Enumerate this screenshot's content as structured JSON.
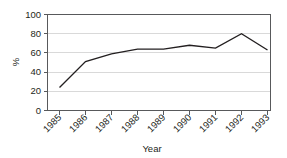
{
  "chart_data": {
    "type": "line",
    "title": "",
    "subtitle": "",
    "xlabel": "Year",
    "ylabel": "%",
    "categories": [
      "1985",
      "1986",
      "1987",
      "1988",
      "1989",
      "1990",
      "1991",
      "1992",
      "1993"
    ],
    "values": [
      24,
      51,
      59,
      64,
      64,
      68,
      65,
      80,
      63
    ],
    "series": [
      {
        "name": "",
        "values": [
          24,
          51,
          59,
          64,
          64,
          68,
          65,
          80,
          63
        ]
      }
    ],
    "ylim": [
      0,
      100
    ],
    "yticks": [
      0,
      20,
      40,
      60,
      80,
      100
    ],
    "ytick_labels": [
      "0",
      "20",
      "40",
      "60",
      "80",
      "100"
    ],
    "xtick_labels": [
      "1985",
      "1986",
      "1987",
      "1988",
      "1989",
      "1990",
      "1991",
      "1992",
      "1993"
    ],
    "xtick_label_rotation": -45,
    "grid": true,
    "grid_axis": "y",
    "legend": false,
    "legend_position": "none",
    "annotations": [],
    "colors": {
      "line": "#231f20",
      "grid": "#d9d9d9",
      "frame": "#58595b",
      "text": "#231f20",
      "background": "#ffffff"
    }
  }
}
